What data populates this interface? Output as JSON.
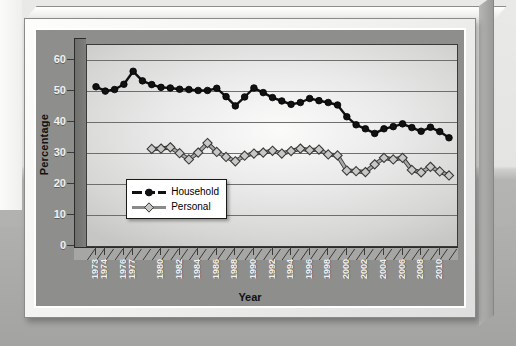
{
  "chart_data": {
    "type": "line",
    "title": "",
    "xlabel": "Year",
    "ylabel": "Percentage",
    "ylim": [
      0,
      65
    ],
    "yticks": [
      0,
      10,
      20,
      30,
      40,
      50,
      60
    ],
    "grid": true,
    "legend_position": "lower-left-inside",
    "xtick_labels": [
      "1973",
      "1974",
      "1976",
      "1977",
      "1980",
      "1982",
      "1984",
      "1986",
      "1988",
      "1990",
      "1992",
      "1994",
      "1996",
      "1998",
      "2000",
      "2002",
      "2004",
      "2006",
      "2008",
      "2010"
    ],
    "x": [
      1973,
      1974,
      1975,
      1976,
      1977,
      1978,
      1979,
      1980,
      1981,
      1982,
      1983,
      1984,
      1985,
      1986,
      1987,
      1988,
      1989,
      1990,
      1991,
      1992,
      1993,
      1994,
      1995,
      1996,
      1997,
      1998,
      1999,
      2000,
      2001,
      2002,
      2003,
      2004,
      2005,
      2006,
      2007,
      2008,
      2009,
      2010,
      2011
    ],
    "series": [
      {
        "name": "Household",
        "marker": "circle",
        "color": "#111111",
        "values": [
          51.5,
          50.1,
          50.6,
          52.3,
          56.5,
          53.4,
          52.2,
          51.3,
          51.1,
          50.7,
          50.6,
          50.3,
          50.3,
          51.0,
          48.3,
          45.3,
          48.2,
          51.1,
          49.6,
          48.0,
          46.9,
          45.8,
          46.4,
          47.7,
          47.0,
          46.4,
          45.6,
          41.8,
          39.2,
          37.9,
          36.4,
          37.9,
          38.6,
          39.5,
          38.3,
          37.1,
          38.4,
          37.0,
          35.0
        ]
      },
      {
        "name": "Personal",
        "marker": "diamond",
        "color": "#b4b4b2",
        "values": [
          null,
          null,
          null,
          null,
          null,
          null,
          31.4,
          31.5,
          31.9,
          30.0,
          28.0,
          30.2,
          33.3,
          30.4,
          28.8,
          27.4,
          29.2,
          29.9,
          30.2,
          30.8,
          29.9,
          30.7,
          31.5,
          31.0,
          31.2,
          29.6,
          29.3,
          24.4,
          24.2,
          23.9,
          26.4,
          28.5,
          28.0,
          28.5,
          24.6,
          23.8,
          25.6,
          24.1,
          22.8
        ]
      }
    ],
    "legend_entries": [
      "Household",
      "Personal"
    ],
    "colors": {
      "background": "#8e8e8c",
      "plot_panel": "#eaeaea",
      "frame": "#f2f2f0",
      "household_line": "#111111",
      "personal_line": "#8a8a88",
      "personal_marker_fill": "#c8c8c6",
      "axis_text": "#f2f2f0"
    }
  }
}
